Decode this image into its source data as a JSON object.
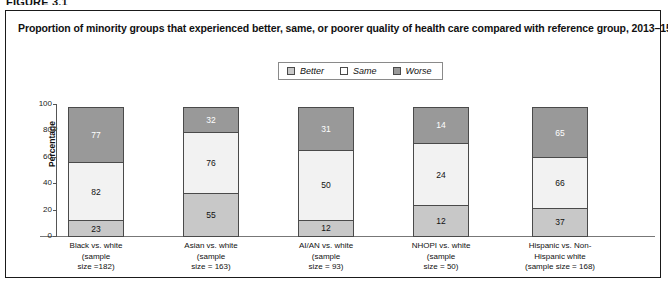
{
  "figure": {
    "label": "FIGURE 3.1"
  },
  "panel": {
    "title": "Proportion of minority groups that experienced better, same, or poorer quality of health care compared with reference group, 2013–15"
  },
  "legend": {
    "items": [
      {
        "label": "Better",
        "color": "#c8c8c8"
      },
      {
        "label": "Same",
        "color": "#ffffff"
      },
      {
        "label": "Worse",
        "color": "#999999"
      }
    ]
  },
  "axes": {
    "ylabel": "Percentage",
    "yticks": [
      "0",
      "20",
      "40",
      "60",
      "80",
      "100"
    ]
  },
  "chart_data": {
    "type": "bar",
    "title": "Proportion of minority groups that experienced better, same, or poorer quality of health care compared with reference group, 2013–15",
    "xlabel": "",
    "ylabel": "Percentage",
    "ylim": [
      0,
      100
    ],
    "grid": false,
    "stacked": true,
    "normalized": true,
    "legend_position": "top-center",
    "categories": [
      "Black vs. white (sample size =182)",
      "Asian vs. white (sample size = 163)",
      "AI/AN vs. white (sample size = 93)",
      "NHOPI vs. white (sample size = 50)",
      "Hispanic vs. Non-Hispanic white (sample size = 168)"
    ],
    "sample_sizes": [
      182,
      163,
      93,
      50,
      168
    ],
    "series": [
      {
        "name": "Better",
        "color": "#c8c8c8",
        "values": [
          23,
          55,
          12,
          12,
          37
        ]
      },
      {
        "name": "Same",
        "color": "#f2f2f2",
        "values": [
          82,
          76,
          50,
          24,
          66
        ]
      },
      {
        "name": "Worse",
        "color": "#999999",
        "values": [
          77,
          32,
          31,
          14,
          65
        ]
      }
    ],
    "percent_series": [
      {
        "name": "Better",
        "values": [
          12.6,
          33.7,
          12.9,
          24.0,
          22.0
        ]
      },
      {
        "name": "Same",
        "values": [
          45.1,
          46.6,
          53.8,
          48.0,
          39.3
        ]
      },
      {
        "name": "Worse",
        "values": [
          42.3,
          19.6,
          33.3,
          28.0,
          38.7
        ]
      }
    ]
  },
  "bars": [
    {
      "label_lines": [
        "Black vs. white",
        "(sample",
        "size =182)"
      ],
      "segments": [
        {
          "name": "Worse",
          "value": "77",
          "pct": 42.3
        },
        {
          "name": "Same",
          "value": "82",
          "pct": 45.1
        },
        {
          "name": "Better",
          "value": "23",
          "pct": 12.6
        }
      ]
    },
    {
      "label_lines": [
        "Asian vs. white",
        "(sample",
        "size = 163)"
      ],
      "segments": [
        {
          "name": "Worse",
          "value": "32",
          "pct": 19.6
        },
        {
          "name": "Same",
          "value": "76",
          "pct": 46.6
        },
        {
          "name": "Better",
          "value": "55",
          "pct": 33.7
        }
      ]
    },
    {
      "label_lines": [
        "AI/AN vs. white",
        "(sample",
        "size = 93)"
      ],
      "segments": [
        {
          "name": "Worse",
          "value": "31",
          "pct": 33.3
        },
        {
          "name": "Same",
          "value": "50",
          "pct": 53.8
        },
        {
          "name": "Better",
          "value": "12",
          "pct": 12.9
        }
      ]
    },
    {
      "label_lines": [
        "NHOPI vs. white",
        "(sample",
        "size = 50)"
      ],
      "segments": [
        {
          "name": "Worse",
          "value": "14",
          "pct": 28.0
        },
        {
          "name": "Same",
          "value": "24",
          "pct": 48.0
        },
        {
          "name": "Better",
          "value": "12",
          "pct": 24.0
        }
      ]
    },
    {
      "label_lines": [
        "Hispanic vs. Non-",
        "Hispanic white",
        "(sample size = 168)"
      ],
      "segments": [
        {
          "name": "Worse",
          "value": "65",
          "pct": 38.7
        },
        {
          "name": "Same",
          "value": "66",
          "pct": 39.3
        },
        {
          "name": "Better",
          "value": "37",
          "pct": 22.0
        }
      ]
    }
  ]
}
